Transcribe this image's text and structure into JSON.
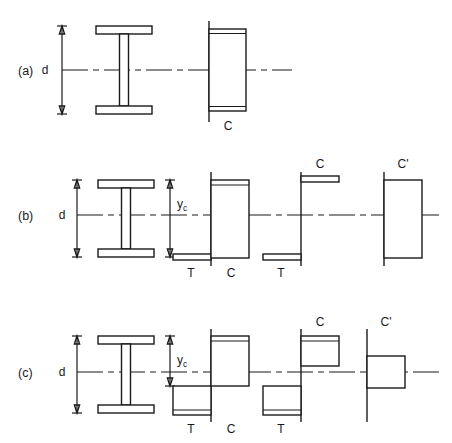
{
  "figure": {
    "title": "",
    "background_color": "#ffffff",
    "line_color": "#1a1a1a",
    "width": 452,
    "height": 443
  },
  "rows": [
    {
      "id": "a",
      "label": "(a)",
      "depth_label": "d",
      "yc_label": "",
      "centerline_y": 70,
      "diagrams": [
        {
          "name": "i-beam-section",
          "caption": ""
        },
        {
          "name": "stress-block-full-compression",
          "caption": "C"
        }
      ],
      "captions": [
        "C"
      ]
    },
    {
      "id": "b",
      "label": "(b)",
      "depth_label": "d",
      "yc_label": "y",
      "yc_subscript": "c",
      "centerline_y": 215,
      "diagrams": [
        {
          "name": "i-beam-section",
          "caption": ""
        },
        {
          "name": "stress-block-tension-compression",
          "caption": "T / C"
        },
        {
          "name": "stress-block-resultant-couple",
          "caption": "C / T"
        },
        {
          "name": "stress-block-net-compression",
          "caption": "C'"
        }
      ],
      "captions": [
        "T",
        "C",
        "C",
        "T",
        "C'"
      ]
    },
    {
      "id": "c",
      "label": "(c)",
      "depth_label": "d",
      "yc_label": "y",
      "yc_subscript": "c",
      "centerline_y": 372,
      "diagrams": [
        {
          "name": "i-beam-section",
          "caption": ""
        },
        {
          "name": "stress-block-tension-compression",
          "caption": "T / C"
        },
        {
          "name": "stress-block-resultant-couple",
          "caption": "C / T"
        },
        {
          "name": "stress-block-net-compression",
          "caption": "C'"
        }
      ],
      "captions": [
        "T",
        "C",
        "C",
        "T",
        "C'"
      ]
    }
  ],
  "labels": {
    "row_a": "(a)",
    "row_b": "(b)",
    "row_c": "(c)",
    "depth": "d",
    "yc_base": "y",
    "yc_sub": "c",
    "compression": "C",
    "tension": "T",
    "net_compression": "C'"
  }
}
